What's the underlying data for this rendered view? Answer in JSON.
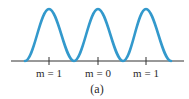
{
  "figure": {
    "caption": "(a)",
    "colors": {
      "curve": "#3399cc",
      "axis": "#333333",
      "text": "#2a2a2a"
    },
    "curve": "intensity pattern with three equal peaks",
    "ticks": [
      {
        "label": "m = 1",
        "x": 49
      },
      {
        "label": "m = 0",
        "x": 98
      },
      {
        "label": "m = 1",
        "x": 146
      }
    ]
  }
}
